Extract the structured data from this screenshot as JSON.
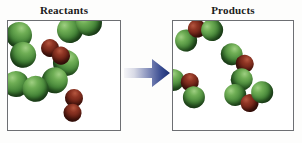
{
  "diagram": {
    "title_reactants": "Reactants",
    "title_products": "Products",
    "arrow_name": "reaction-arrow",
    "colors": {
      "atom_green": "#3f7f34",
      "atom_red": "#6d2115",
      "panel_border": "#6d6f73",
      "panel_background": "#ffffff",
      "arrow_start": "#f2f2f4",
      "arrow_end": "#1f3a80",
      "background": "#fdfdfc",
      "title_text": "#1a1a1a"
    }
  },
  "chart_data": {
    "type": "diagram",
    "xlabel": "",
    "ylabel": "",
    "legend_position": "none",
    "grid": false,
    "panels": [
      {
        "label": "Reactants",
        "molecule_counts": [
          {
            "formula": "green-green diatomic",
            "count": 4
          },
          {
            "formula": "red-red diatomic",
            "count": 2
          }
        ],
        "molecules": [
          {
            "name": "green-diatomic",
            "x": 11,
            "y": 14,
            "rotation": 58,
            "atoms": [
              {
                "element": "green",
                "cx": 0,
                "cy": 0,
                "r": 13
              },
              {
                "element": "green",
                "cx": 19,
                "cy": 7,
                "r": 13
              }
            ]
          },
          {
            "name": "green-diatomic",
            "x": 62,
            "y": 9,
            "rotation": -12,
            "atoms": [
              {
                "element": "green",
                "cx": 0,
                "cy": 0,
                "r": 13
              },
              {
                "element": "green",
                "cx": 20,
                "cy": -3,
                "r": 13
              }
            ]
          },
          {
            "name": "green-diatomic",
            "x": 58,
            "y": 42,
            "rotation": 72,
            "atoms": [
              {
                "element": "green",
                "cx": 0,
                "cy": 0,
                "r": 13
              },
              {
                "element": "green",
                "cx": 13,
                "cy": 16,
                "r": 13
              }
            ]
          },
          {
            "name": "green-diatomic",
            "x": 8,
            "y": 63,
            "rotation": 8,
            "atoms": [
              {
                "element": "green",
                "cx": 0,
                "cy": 0,
                "r": 13
              },
              {
                "element": "green",
                "cx": 20,
                "cy": 2,
                "r": 13
              }
            ]
          },
          {
            "name": "red-diatomic",
            "x": 42,
            "y": 27,
            "rotation": 22,
            "atoms": [
              {
                "element": "red",
                "cx": 0,
                "cy": 0,
                "r": 9
              },
              {
                "element": "red",
                "cx": 13,
                "cy": 3,
                "r": 9
              }
            ]
          },
          {
            "name": "red-diatomic",
            "x": 66,
            "y": 77,
            "rotation": 48,
            "atoms": [
              {
                "element": "red",
                "cx": 0,
                "cy": 0,
                "r": 9
              },
              {
                "element": "red",
                "cx": 10,
                "cy": 11,
                "r": 9
              }
            ]
          }
        ]
      },
      {
        "label": "Products",
        "molecule_counts": [
          {
            "formula": "green-red-green triatomic",
            "count": 4
          }
        ],
        "molecules": [
          {
            "name": "triatomic-green-red-green",
            "x": 10,
            "y": 10,
            "rotation": -18,
            "atoms": [
              {
                "element": "green",
                "cx": 0,
                "cy": 10,
                "r": 11
              },
              {
                "element": "red",
                "cx": 14,
                "cy": 2,
                "r": 9
              },
              {
                "element": "green",
                "cx": 28,
                "cy": 8,
                "r": 11
              }
            ]
          },
          {
            "name": "triatomic-green-red-green",
            "x": 66,
            "y": 30,
            "rotation": 66,
            "atoms": [
              {
                "element": "green",
                "cx": 0,
                "cy": 8,
                "r": 11
              },
              {
                "element": "red",
                "cx": 14,
                "cy": 0,
                "r": 9
              },
              {
                "element": "green",
                "cx": 27,
                "cy": 9,
                "r": 11
              }
            ]
          },
          {
            "name": "triatomic-green-red-green",
            "x": 6,
            "y": 52,
            "rotation": 40,
            "atoms": [
              {
                "element": "green",
                "cx": 0,
                "cy": 9,
                "r": 11
              },
              {
                "element": "red",
                "cx": 14,
                "cy": 0,
                "r": 9
              },
              {
                "element": "green",
                "cx": 27,
                "cy": 9,
                "r": 11
              }
            ]
          },
          {
            "name": "triatomic-green-red-green",
            "x": 62,
            "y": 72,
            "rotation": -8,
            "atoms": [
              {
                "element": "green",
                "cx": 0,
                "cy": 2,
                "r": 11
              },
              {
                "element": "red",
                "cx": 13,
                "cy": 12,
                "r": 9
              },
              {
                "element": "green",
                "cx": 27,
                "cy": 3,
                "r": 11
              }
            ]
          }
        ]
      }
    ],
    "arrow": {
      "direction": "right",
      "from": "Reactants",
      "to": "Products"
    }
  }
}
